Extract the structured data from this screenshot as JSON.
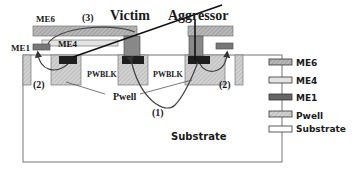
{
  "figure": {
    "labels": {
      "victim": "Victim",
      "aggressor": "Aggressor",
      "path3": "(3)",
      "path1": "(1)",
      "path2_left": "(2)",
      "path2_right": "(2)",
      "me6": "ME6",
      "me4": "ME4",
      "me1": "ME1",
      "pwblk_left": "PWBLK",
      "pwblk_right": "PWBLK",
      "pwell": "Pwell",
      "substrate": "Substrate"
    },
    "legend": [
      {
        "label": "ME6",
        "fill": "#bdbdbd"
      },
      {
        "label": "ME4",
        "fill": "#d6d6d6"
      },
      {
        "label": "ME1",
        "fill": "#555555"
      },
      {
        "label": "Pwell",
        "fill": "#c8c8c8"
      },
      {
        "label": "Substrate",
        "fill": "#ffffff"
      }
    ],
    "colors": {
      "me6": "#bdbdbd",
      "me4": "#d6d6d6",
      "me1": "#6e6e6e",
      "contact": "#1e1e1e",
      "pwell": "#cfcfcf",
      "outline": "#555555",
      "arrow": "#333333"
    }
  }
}
